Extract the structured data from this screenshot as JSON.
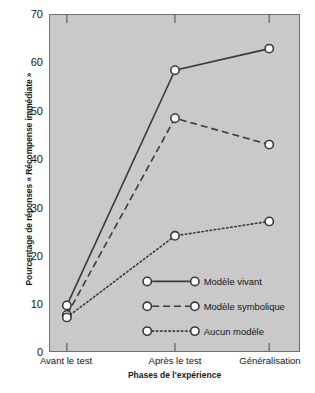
{
  "chart_data": {
    "type": "line",
    "title": "",
    "xlabel": "Phases de l'expérience",
    "ylabel": "Pourcentage de réponses « Récompense immédiate »",
    "categories": [
      "Avant le test",
      "Après le test",
      "Généralisation"
    ],
    "ylim": [
      0,
      70
    ],
    "yticks": [
      0,
      10,
      20,
      30,
      40,
      50,
      60,
      70
    ],
    "grid": false,
    "legend_position": "inside-bottom-right",
    "series": [
      {
        "name": "Modèle vivant",
        "values": [
          9.5,
          58.5,
          63
        ],
        "linestyle": "solid",
        "marker": "circle-open"
      },
      {
        "name": "Modèle symbolique",
        "values": [
          7.5,
          48.5,
          43
        ],
        "linestyle": "dashed",
        "marker": "circle-open"
      },
      {
        "name": "Aucun modèle",
        "values": [
          7,
          24,
          27
        ],
        "linestyle": "dotted",
        "marker": "circle-open"
      }
    ],
    "colors": {
      "plot_background": "#c9c9c9",
      "frame": "#6f6f6f",
      "line": "#3a3a3a",
      "marker_fill": "#ffffff",
      "text": "#141414",
      "page_background": "#ffffff"
    }
  },
  "ytick_labels": [
    "70",
    "60",
    "50",
    "40",
    "30",
    "20",
    "10",
    "0"
  ],
  "legend": {
    "items": [
      {
        "label": "Modèle vivant"
      },
      {
        "label": "Modèle symbolique"
      },
      {
        "label": "Aucun modèle"
      }
    ]
  }
}
